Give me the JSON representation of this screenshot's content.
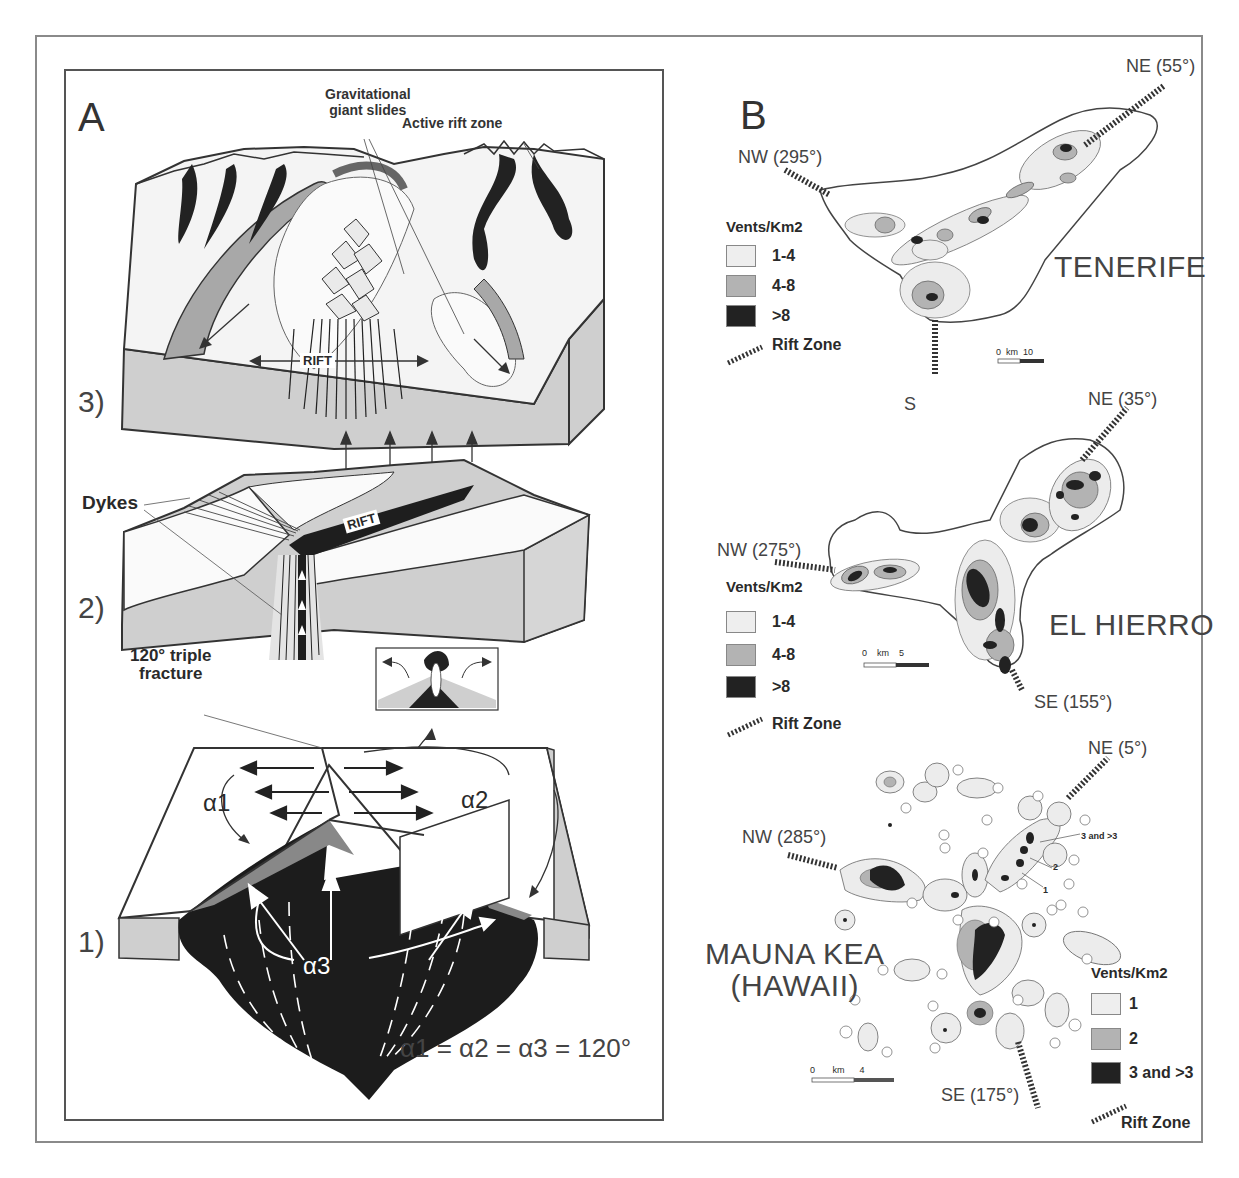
{
  "figure": {
    "panel_a": {
      "label": "A",
      "annotations": {
        "gravitational_slides": [
          "Gravitational",
          "giant slides"
        ],
        "active_rift_zone": "Active rift zone",
        "rift_label_3": "RIFT",
        "rift_label_2": "RIFT",
        "dykes": "Dykes",
        "triple_fracture": [
          "120° triple",
          "fracture"
        ],
        "alpha1": "α1",
        "alpha2": "α2",
        "alpha3": "α3",
        "equation": "α1 = α2 = α3 = 120°"
      },
      "steps": [
        "3)",
        "2)",
        "1)"
      ]
    },
    "panel_b": {
      "label": "B",
      "islands": [
        {
          "name": "TENERIFE",
          "rift_zones": [
            "NE (55°)",
            "NW (295°)",
            "S"
          ],
          "legend": {
            "title": "Vents/Km2",
            "classes": [
              "1-4",
              "4-8",
              ">8"
            ],
            "rift_label": "Rift Zone"
          },
          "scale": {
            "start": "0",
            "unit": "km",
            "end": "10"
          }
        },
        {
          "name": "EL HIERRO",
          "rift_zones": [
            "NE (35°)",
            "NW (275°)",
            "SE (155°)"
          ],
          "legend": {
            "title": "Vents/Km2",
            "classes": [
              "1-4",
              "4-8",
              ">8"
            ],
            "rift_label": "Rift Zone"
          },
          "scale": {
            "start": "0",
            "unit": "km",
            "end": "5"
          }
        },
        {
          "name": [
            "MAUNA KEA",
            "(HAWAII)"
          ],
          "rift_zones": [
            "NE (5°)",
            "NW (285°)",
            "SE (175°)"
          ],
          "contour_labels": [
            "3 and >3",
            "2",
            "1"
          ],
          "legend": {
            "title": "Vents/Km2",
            "classes": [
              "1",
              "2",
              "3 and >3"
            ],
            "rift_label": "Rift Zone"
          },
          "scale": {
            "start": "0",
            "unit": "km",
            "end": "4"
          }
        }
      ]
    },
    "colors": {
      "light": "#eeeeee",
      "medium": "#b3b3b3",
      "dark": "#222222",
      "crust": "#cfcfcf",
      "outline": "#444444"
    }
  }
}
